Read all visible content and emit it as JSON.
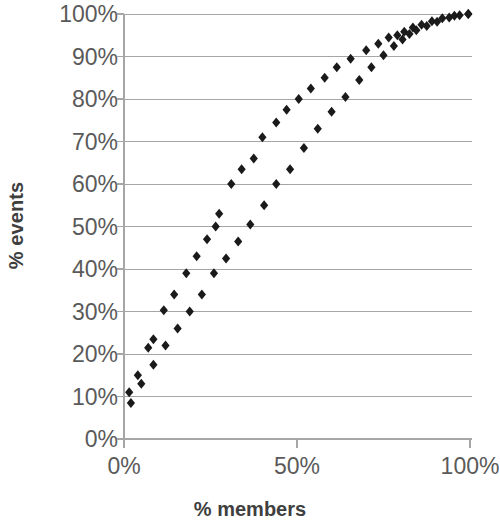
{
  "chart_data": {
    "type": "scatter",
    "title": "",
    "xlabel": "% members",
    "ylabel": "% events",
    "xlim": [
      0,
      100
    ],
    "ylim": [
      0,
      100
    ],
    "grid": true,
    "grid_axis": "y",
    "legend": "none",
    "x_ticks": [
      "0%",
      "50%",
      "100%"
    ],
    "x_tick_values": [
      0,
      50,
      100
    ],
    "y_ticks": [
      "0%",
      "10%",
      "20%",
      "30%",
      "40%",
      "50%",
      "60%",
      "70%",
      "80%",
      "90%",
      "100%"
    ],
    "y_tick_values": [
      0,
      10,
      20,
      30,
      40,
      50,
      60,
      70,
      80,
      90,
      100
    ],
    "marker": "diamond",
    "marker_color": "#1a1a1a",
    "marker_size": 5,
    "series": [
      {
        "name": "upper curve",
        "points": [
          [
            1.5,
            11.0
          ],
          [
            4.0,
            15.0
          ],
          [
            7.0,
            21.5
          ],
          [
            8.5,
            23.5
          ],
          [
            11.5,
            30.3
          ],
          [
            14.5,
            34.0
          ],
          [
            18.0,
            39.0
          ],
          [
            21.0,
            43.0
          ],
          [
            24.0,
            47.0
          ],
          [
            26.5,
            50.0
          ],
          [
            27.5,
            53.0
          ],
          [
            31.0,
            60.0
          ],
          [
            34.0,
            63.5
          ],
          [
            37.5,
            66.0
          ],
          [
            40.0,
            71.0
          ],
          [
            44.0,
            74.5
          ],
          [
            47.0,
            77.5
          ],
          [
            50.5,
            80.0
          ],
          [
            54.0,
            82.5
          ],
          [
            58.0,
            85.0
          ],
          [
            61.5,
            87.5
          ],
          [
            65.5,
            89.5
          ],
          [
            70.0,
            91.5
          ],
          [
            73.5,
            93.0
          ],
          [
            76.5,
            94.5
          ],
          [
            79.0,
            95.0
          ],
          [
            81.0,
            95.8
          ],
          [
            83.5,
            96.8
          ],
          [
            86.0,
            97.5
          ],
          [
            89.0,
            98.3
          ],
          [
            92.0,
            99.0
          ],
          [
            95.5,
            99.6
          ],
          [
            99.5,
            100.0
          ]
        ]
      },
      {
        "name": "lower curve",
        "points": [
          [
            2.0,
            8.5
          ],
          [
            5.0,
            13.0
          ],
          [
            8.5,
            17.5
          ],
          [
            12.0,
            22.0
          ],
          [
            15.5,
            26.0
          ],
          [
            19.0,
            30.0
          ],
          [
            22.5,
            34.0
          ],
          [
            26.0,
            39.0
          ],
          [
            29.5,
            42.5
          ],
          [
            33.0,
            46.5
          ],
          [
            36.5,
            50.5
          ],
          [
            40.5,
            55.0
          ],
          [
            44.0,
            60.0
          ],
          [
            48.0,
            63.5
          ],
          [
            52.0,
            68.5
          ],
          [
            56.0,
            73.0
          ],
          [
            60.0,
            77.0
          ],
          [
            64.0,
            80.5
          ],
          [
            68.0,
            84.5
          ],
          [
            71.5,
            87.5
          ],
          [
            75.0,
            90.3
          ],
          [
            78.0,
            92.5
          ],
          [
            80.5,
            94.0
          ],
          [
            82.5,
            95.3
          ],
          [
            84.5,
            96.2
          ],
          [
            87.5,
            97.2
          ],
          [
            90.5,
            98.2
          ],
          [
            94.0,
            99.2
          ],
          [
            97.0,
            99.7
          ],
          [
            99.5,
            100.0
          ]
        ]
      }
    ]
  },
  "axes": {
    "y_title": "% events",
    "x_title": "% members"
  },
  "style": {
    "gridline_color": "#a6a6a6",
    "axis_color": "#a6a6a6",
    "tick_label_color": "#5a5a5a",
    "title_color": "#3f3f3f",
    "background": "#ffffff"
  }
}
